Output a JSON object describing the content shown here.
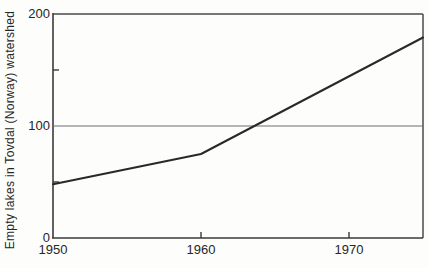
{
  "figure": {
    "background": "#fdfdfc",
    "data_line_color": "#292929",
    "axis_color": "#3a3a3a",
    "grid_color": "#6f6f6f"
  },
  "chart_data": {
    "type": "line",
    "title": "",
    "xlabel": "",
    "ylabel": "Empty lakes in Tovdal (Norway) watershed",
    "x": [
      1950,
      1960,
      1975
    ],
    "values": [
      48,
      75,
      179
    ],
    "xlim": [
      1950,
      1975
    ],
    "ylim": [
      0,
      200
    ],
    "x_ticks": [
      1950,
      1960,
      1970
    ],
    "x_tick_labels": [
      "1950",
      "1960",
      "1970"
    ],
    "y_ticks": [
      0,
      100,
      200
    ],
    "y_tick_labels": [
      "0",
      "100",
      "200"
    ],
    "y_minor_ticks": [
      50,
      150
    ],
    "gridlines_y": [
      100
    ],
    "grid": "single horizontal reference line at 100",
    "legend_position": "none",
    "series": [
      {
        "name": "empty-lakes",
        "x": [
          1950,
          1960,
          1975
        ],
        "values": [
          48,
          75,
          179
        ]
      }
    ]
  }
}
